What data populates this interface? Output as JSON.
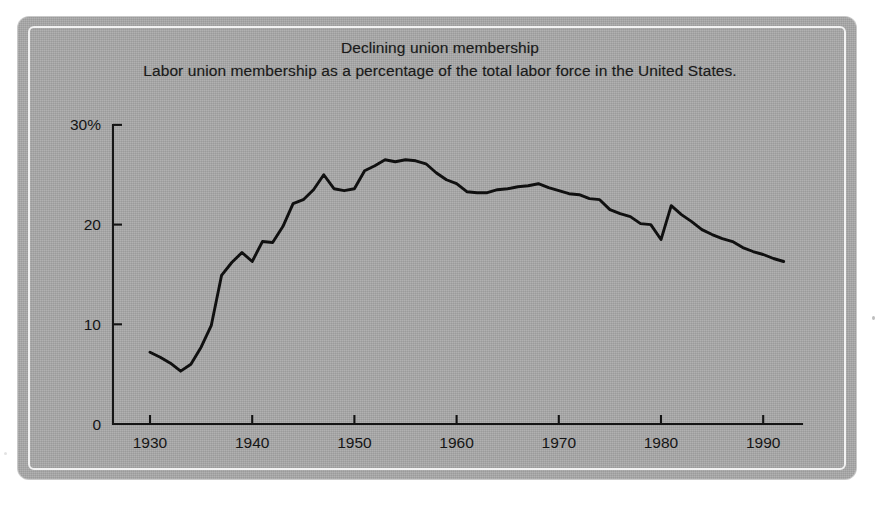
{
  "figure": {
    "title": "Declining union membership",
    "subtitle": "Labor union membership as a percentage of the total labor force in the United States.",
    "caption": "",
    "panel_color": "#a9a9a9",
    "line_color": "#101010",
    "text_color": "#151515"
  },
  "axes": {
    "y_ticks": [
      "30%",
      "20",
      "10",
      "0"
    ],
    "y_tick_values": [
      30,
      20,
      10,
      0
    ],
    "x_ticks": [
      "1930",
      "1940",
      "1950",
      "1960",
      "1970",
      "1980",
      "1990"
    ],
    "x_tick_values": [
      1930,
      1940,
      1950,
      1960,
      1970,
      1980,
      1990
    ]
  },
  "chart_data": {
    "type": "line",
    "title": "Declining union membership",
    "subtitle": "Labor union membership as a percentage of the total labor force in the United States.",
    "xlabel": "",
    "ylabel": "",
    "ylim": [
      0,
      30
    ],
    "xlim": [
      1928,
      1994
    ],
    "grid": false,
    "legend": "none",
    "y_unit": "percent",
    "x": [
      1930,
      1931,
      1932,
      1933,
      1934,
      1935,
      1936,
      1937,
      1938,
      1939,
      1940,
      1941,
      1942,
      1943,
      1944,
      1945,
      1946,
      1947,
      1948,
      1949,
      1950,
      1951,
      1952,
      1953,
      1954,
      1955,
      1956,
      1957,
      1958,
      1959,
      1960,
      1961,
      1962,
      1963,
      1964,
      1965,
      1966,
      1967,
      1968,
      1969,
      1970,
      1971,
      1972,
      1973,
      1974,
      1975,
      1976,
      1977,
      1978,
      1979,
      1980,
      1981,
      1982,
      1983,
      1984,
      1985,
      1986,
      1987,
      1988,
      1989,
      1990,
      1991,
      1992
    ],
    "y": [
      7.2,
      6.7,
      6.1,
      5.3,
      6.0,
      7.7,
      9.9,
      14.9,
      16.2,
      17.2,
      16.3,
      18.3,
      18.2,
      19.8,
      22.1,
      22.5,
      23.5,
      25.0,
      23.6,
      23.4,
      23.6,
      25.4,
      25.9,
      26.5,
      26.3,
      26.5,
      26.4,
      26.1,
      25.2,
      24.5,
      24.1,
      23.3,
      23.2,
      23.2,
      23.5,
      23.6,
      23.8,
      23.9,
      24.1,
      23.7,
      23.4,
      23.1,
      23.0,
      22.6,
      22.5,
      21.5,
      21.1,
      20.8,
      20.1,
      20.0,
      18.5,
      21.9,
      21.0,
      20.3,
      19.5,
      19.0,
      18.6,
      18.3,
      17.7,
      17.3,
      17.0,
      16.6,
      16.3
    ]
  }
}
